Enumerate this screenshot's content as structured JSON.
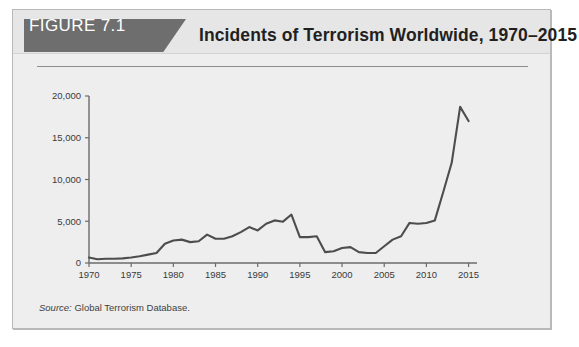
{
  "figure": {
    "tab_label": "FIGURE 7.1",
    "title": "Incidents of Terrorism Worldwide, 1970–2015",
    "source_label": "Source:",
    "source_text": " Global Terrorism Database."
  },
  "colors": {
    "tab_background": "#6e6e6e",
    "tab_text": "#ffffff",
    "panel_background": "#eeeeee",
    "header_background": "#e6e6e6",
    "panel_border": "#b9b9b9",
    "title_text": "#231f20",
    "line_series": "#4d4d4d",
    "axis": "#6b6b6b",
    "rule": "#8c8c8c"
  },
  "chart_data": {
    "type": "line",
    "title": "Incidents of Terrorism Worldwide, 1970–2015",
    "xlabel": "",
    "ylabel": "",
    "xlim": [
      1970,
      2016
    ],
    "ylim": [
      0,
      20000
    ],
    "grid": false,
    "legend": "none",
    "y_ticks": [
      0,
      5000,
      10000,
      15000,
      20000
    ],
    "y_tick_labels": [
      "0",
      "5,000",
      "10,000",
      "15,000",
      "20,000"
    ],
    "x_ticks": [
      1970,
      1975,
      1980,
      1985,
      1990,
      1995,
      2000,
      2005,
      2010,
      2015
    ],
    "x_tick_labels": [
      "1970",
      "1975",
      "1980",
      "1985",
      "1990",
      "1995",
      "2000",
      "2005",
      "2010",
      "2015"
    ],
    "series": [
      {
        "name": "Terrorist incidents",
        "color": "#4d4d4d",
        "x": [
          1970,
          1971,
          1972,
          1973,
          1974,
          1975,
          1976,
          1977,
          1978,
          1979,
          1980,
          1981,
          1982,
          1983,
          1984,
          1985,
          1986,
          1987,
          1988,
          1989,
          1990,
          1991,
          1992,
          1993,
          1994,
          1995,
          1996,
          1997,
          1998,
          1999,
          2000,
          2001,
          2002,
          2003,
          2004,
          2005,
          2006,
          2007,
          2008,
          2009,
          2010,
          2011,
          2012,
          2013,
          2014,
          2015
        ],
        "y": [
          650,
          450,
          500,
          500,
          550,
          650,
          800,
          1000,
          1200,
          2300,
          2700,
          2800,
          2500,
          2600,
          3400,
          2900,
          2900,
          3200,
          3700,
          4300,
          3900,
          4700,
          5100,
          4950,
          5800,
          3100,
          3100,
          3200,
          1300,
          1400,
          1800,
          1900,
          1300,
          1200,
          1200,
          2000,
          2800,
          3200,
          4800,
          4700,
          4800,
          5100,
          8500,
          12000,
          18700,
          17000
        ]
      }
    ]
  },
  "layout": {
    "plot_left": 88,
    "plot_right": 476,
    "plot_top": 95,
    "plot_bottom": 262,
    "x_per_year": 8.42,
    "y_per_unit": 0.00835
  }
}
